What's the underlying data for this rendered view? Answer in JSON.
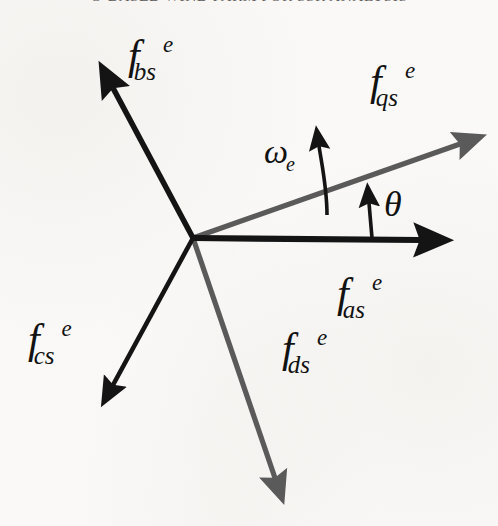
{
  "page": {
    "header_text": "O-BASED WIND FARM FOR SSR ANALYSIS",
    "background_color": "#faf9f7"
  },
  "diagram": {
    "origin": {
      "x": 193,
      "y": 238
    },
    "colors": {
      "abc_axis": "#141414",
      "qd_axis": "#5a5a5a",
      "text": "#121212"
    },
    "vectors": [
      {
        "id": "f_as",
        "name": "f-as-axis",
        "label_base": "f",
        "label_sub": "as",
        "label_sup": "e",
        "color": "#141414",
        "tip": {
          "x": 445,
          "y": 240
        },
        "angle_deg": 0,
        "group": "abc"
      },
      {
        "id": "f_bs",
        "name": "f-bs-axis",
        "label_base": "f",
        "label_sub": "bs",
        "label_sup": "e",
        "color": "#141414",
        "tip": {
          "x": 95,
          "y": 63
        },
        "angle_deg": 120,
        "group": "abc"
      },
      {
        "id": "f_cs",
        "name": "f-cs-axis",
        "label_base": "f",
        "label_sub": "cs",
        "label_sup": "e",
        "color": "#141414",
        "tip": {
          "x": 103,
          "y": 410
        },
        "angle_deg": -120,
        "group": "abc"
      },
      {
        "id": "f_qs",
        "name": "f-qs-axis",
        "label_base": "f",
        "label_sub": "qs",
        "label_sup": "e",
        "color": "#5a5a5a",
        "tip": {
          "x": 472,
          "y": 140
        },
        "angle_deg": 20,
        "group": "qd"
      },
      {
        "id": "f_ds",
        "name": "f-ds-axis",
        "label_base": "f",
        "label_sub": "ds",
        "label_sup": "e",
        "color": "#5a5a5a",
        "tip": {
          "x": 283,
          "y": 500
        },
        "angle_deg": -70,
        "group": "qd"
      }
    ],
    "annotations": [
      {
        "id": "omega_e",
        "name": "omega-e-rotation",
        "label_base": "ω",
        "label_sub": "e",
        "label_sup": "",
        "color": "#141414",
        "arrow_from": {
          "x": 327,
          "y": 215
        },
        "arrow_to": {
          "x": 318,
          "y": 124
        }
      },
      {
        "id": "theta",
        "name": "theta-angle",
        "label_base": "θ",
        "label_sub": "",
        "label_sup": "",
        "color": "#141414",
        "arrow_from": {
          "x": 372,
          "y": 238
        },
        "arrow_to": {
          "x": 368,
          "y": 182
        }
      }
    ],
    "labels": {
      "f_as": {
        "x": 337,
        "y": 272
      },
      "f_bs": {
        "x": 128,
        "y": 34
      },
      "f_cs": {
        "x": 28,
        "y": 318
      },
      "f_ds": {
        "x": 282,
        "y": 327
      },
      "f_qs": {
        "x": 370,
        "y": 60
      },
      "omega_e": {
        "x": 264,
        "y": 135
      },
      "theta": {
        "x": 384,
        "y": 186
      }
    }
  }
}
